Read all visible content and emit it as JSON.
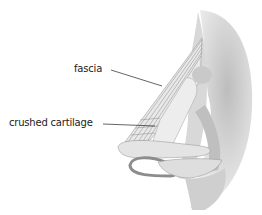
{
  "diagram": {
    "labels": [
      {
        "id": "fascia",
        "text": "fascia"
      },
      {
        "id": "crushed-cartilage",
        "text": "crushed cartilage"
      }
    ]
  }
}
